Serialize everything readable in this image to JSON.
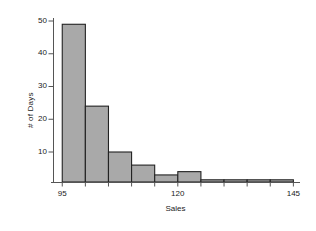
{
  "chart_data": {
    "type": "bar",
    "title": "",
    "subtitle": "",
    "xlabel": "Sales",
    "ylabel": "# of Days",
    "grid": false,
    "legend": false,
    "legend_position": "none",
    "bar_fill_color": "#a9a9a9",
    "bar_edge_color": "#222222",
    "axis_color": "#555555",
    "text_color": "#1a1a1a",
    "xlim": [
      93,
      146
    ],
    "ylim": [
      0,
      52
    ],
    "xtick_labels": [
      "95",
      "120",
      "145"
    ],
    "xtick_values": [
      95,
      120,
      145
    ],
    "xminor_values": [
      100,
      105,
      110,
      115,
      125,
      130,
      135,
      140
    ],
    "ytick_labels": [
      "10",
      "20",
      "30",
      "40",
      "50"
    ],
    "ytick_values": [
      10,
      20,
      30,
      40,
      50
    ],
    "bin_width": 5,
    "bin_edges": [
      95,
      100,
      105,
      110,
      115,
      120,
      125,
      130,
      135,
      140,
      145
    ],
    "categories": [
      "95-100",
      "100-105",
      "105-110",
      "110-115",
      "115-120",
      "120-125",
      "125-130",
      "130-135",
      "135-140",
      "140-145"
    ],
    "values": [
      49,
      24,
      10,
      6,
      3,
      4,
      0,
      0,
      0,
      0
    ],
    "bars": [
      {
        "x0": 95,
        "x1": 100,
        "value": 49
      },
      {
        "x0": 100,
        "x1": 105,
        "value": 24
      },
      {
        "x0": 105,
        "x1": 110,
        "value": 10
      },
      {
        "x0": 110,
        "x1": 115,
        "value": 6
      },
      {
        "x0": 115,
        "x1": 120,
        "value": 3
      },
      {
        "x0": 120,
        "x1": 125,
        "value": 4
      },
      {
        "x0": 125,
        "x1": 130,
        "value": 0
      },
      {
        "x0": 130,
        "x1": 135,
        "value": 0
      },
      {
        "x0": 135,
        "x1": 140,
        "value": 0
      },
      {
        "x0": 140,
        "x1": 145,
        "value": 0
      }
    ]
  },
  "figure": {
    "background": "#ffffff",
    "plot_left_px": 53,
    "plot_right_px": 298,
    "plot_baseline_px": 182,
    "plot_top_px": 18
  }
}
